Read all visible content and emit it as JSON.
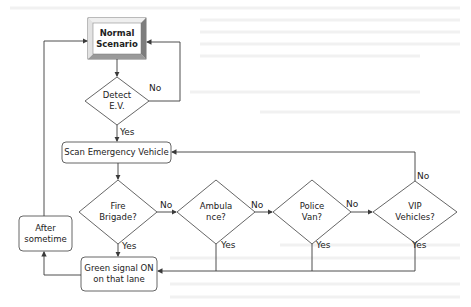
{
  "diagram": {
    "type": "flowchart",
    "nodes": {
      "start": {
        "label": "Normal\nScenario",
        "shape": "beveled-rectangle"
      },
      "detect": {
        "label": "Detect\nE.V.",
        "shape": "diamond"
      },
      "scan": {
        "label": "Scan Emergency Vehicle",
        "shape": "rounded-rectangle"
      },
      "fire": {
        "label": "Fire\nBrigade?",
        "shape": "diamond"
      },
      "ambulance": {
        "label": "Ambula\nnce?",
        "shape": "diamond"
      },
      "police": {
        "label": "Police\nVan?",
        "shape": "diamond"
      },
      "vip": {
        "label": "VIP\nVehicles?",
        "shape": "diamond"
      },
      "green": {
        "label": "Green signal ON\non that lane",
        "shape": "rounded-rectangle"
      },
      "after": {
        "label": "After\nsometime",
        "shape": "rounded-rectangle"
      }
    },
    "edges": [
      {
        "from": "start",
        "to": "detect",
        "label": ""
      },
      {
        "from": "detect",
        "to": "start",
        "label": "No"
      },
      {
        "from": "detect",
        "to": "scan",
        "label": "Yes"
      },
      {
        "from": "scan",
        "to": "fire",
        "label": ""
      },
      {
        "from": "fire",
        "to": "ambulance",
        "label": "No"
      },
      {
        "from": "ambulance",
        "to": "police",
        "label": "No"
      },
      {
        "from": "police",
        "to": "vip",
        "label": "No"
      },
      {
        "from": "vip",
        "to": "scan",
        "label": "No"
      },
      {
        "from": "fire",
        "to": "green",
        "label": "Yes"
      },
      {
        "from": "ambulance",
        "to": "green",
        "label": "Yes"
      },
      {
        "from": "police",
        "to": "green",
        "label": "Yes"
      },
      {
        "from": "vip",
        "to": "green",
        "label": "Yes"
      },
      {
        "from": "green",
        "to": "after",
        "label": ""
      },
      {
        "from": "after",
        "to": "start",
        "label": ""
      }
    ],
    "edge_labels": {
      "detect_no": "No",
      "detect_yes": "Yes",
      "fire_no": "No",
      "ambulance_no": "No",
      "police_no": "No",
      "vip_no": "No",
      "fire_yes": "Yes",
      "ambulance_yes": "Yes",
      "police_yes": "Yes",
      "vip_yes": "Yes"
    }
  },
  "colors": {
    "line": "#3a3a3a",
    "node_fill": "#ffffff",
    "bevel_light": "#e6e6e6",
    "bevel_dark": "#8a8a8a",
    "text": "#222222",
    "background": "#ffffff"
  }
}
